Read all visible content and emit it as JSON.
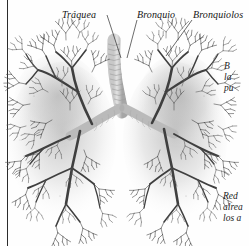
{
  "figure": {
    "kind": "anatomical-illustration",
    "background_color": "#fefefe",
    "ink_color": "#3d3d3d",
    "margin_rule_color": "#2b2b2b"
  },
  "labels": [
    {
      "id": "traquea",
      "text": "Tráquea"
    },
    {
      "id": "bronquio",
      "text": "Bronquio"
    },
    {
      "id": "bronquiolos",
      "text": "Bronquiolos"
    }
  ],
  "captions": [
    {
      "id": "bronquios",
      "lines": [
        "B",
        "la",
        "pu"
      ]
    },
    {
      "id": "red",
      "lines": [
        "Red",
        "alrea",
        "los a"
      ]
    }
  ]
}
